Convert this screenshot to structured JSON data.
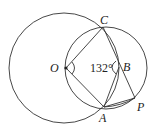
{
  "figure": {
    "points": {
      "O": {
        "label": "O",
        "x": 66,
        "y": 68
      },
      "C": {
        "label": "C",
        "x": 103,
        "y": 27
      },
      "A": {
        "label": "A",
        "x": 104,
        "y": 107
      },
      "B": {
        "label": "B",
        "x": 119,
        "y": 67
      },
      "P": {
        "label": "P",
        "x": 135,
        "y": 98
      }
    },
    "circles": [
      {
        "name": "circle-O",
        "cx": 64,
        "cy": 68,
        "r": 55
      },
      {
        "name": "circle-OCA",
        "cx": 106,
        "cy": 68,
        "r": 41
      }
    ],
    "angle_label": "132°",
    "stroke_color": "#333333"
  }
}
